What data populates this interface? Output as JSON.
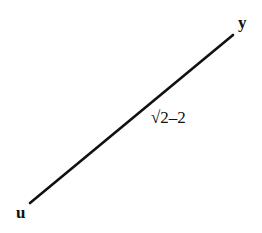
{
  "diagram": {
    "type": "graph-edge",
    "nodes": [
      {
        "id": "u",
        "label": "u"
      },
      {
        "id": "y",
        "label": "y"
      }
    ],
    "edges": [
      {
        "from": "u",
        "to": "y",
        "label": "√2–2"
      }
    ],
    "colors": {
      "line": "#111111",
      "background": "#ffffff"
    }
  }
}
